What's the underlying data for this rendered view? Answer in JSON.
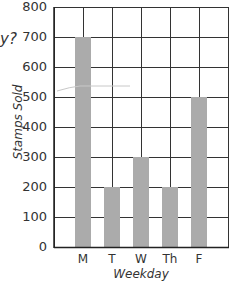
{
  "cropped_question_fragment": "y?",
  "chart_data": {
    "type": "bar",
    "title": "",
    "xlabel": "Weekday",
    "ylabel": "Stamps Sold",
    "categories": [
      "M",
      "T",
      "W",
      "Th",
      "F"
    ],
    "values": [
      700,
      200,
      300,
      200,
      500
    ],
    "ylim": [
      0,
      800
    ],
    "yticks": [
      0,
      100,
      200,
      300,
      400,
      500,
      600,
      700,
      800
    ],
    "grid": true,
    "legend": null,
    "bar_color": "#ababab",
    "grid_color": "#333333",
    "annotations": [
      "faint hand-drawn pencil stroke across plot near y≈540"
    ]
  }
}
